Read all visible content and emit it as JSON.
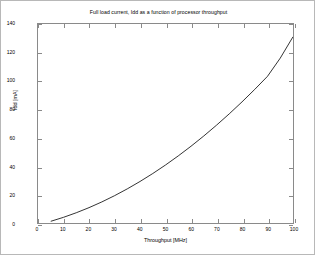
{
  "chart_data": {
    "type": "line",
    "title": "Full load current, Idd as a function of processor throughput",
    "xlabel": "Throughput [MHz]",
    "ylabel": "Idd [mA]",
    "xlim": [
      0,
      100
    ],
    "ylim": [
      0,
      140
    ],
    "xticks": [
      0,
      10,
      20,
      30,
      40,
      50,
      60,
      70,
      80,
      90,
      100
    ],
    "yticks": [
      0,
      20,
      40,
      60,
      80,
      100,
      120,
      140
    ],
    "grid": false,
    "legend": null,
    "line_color": "#000000",
    "series": [
      {
        "name": "Idd",
        "x": [
          5,
          10,
          15,
          20,
          25,
          30,
          35,
          40,
          45,
          50,
          55,
          60,
          65,
          70,
          75,
          80,
          85,
          90,
          95,
          100
        ],
        "values": [
          1.2,
          4.0,
          7.2,
          10.8,
          14.8,
          19.2,
          24.0,
          29.2,
          34.8,
          40.8,
          47.2,
          54.0,
          61.2,
          68.8,
          76.8,
          85.2,
          94.0,
          103.2,
          116.0,
          131.0
        ]
      }
    ]
  }
}
